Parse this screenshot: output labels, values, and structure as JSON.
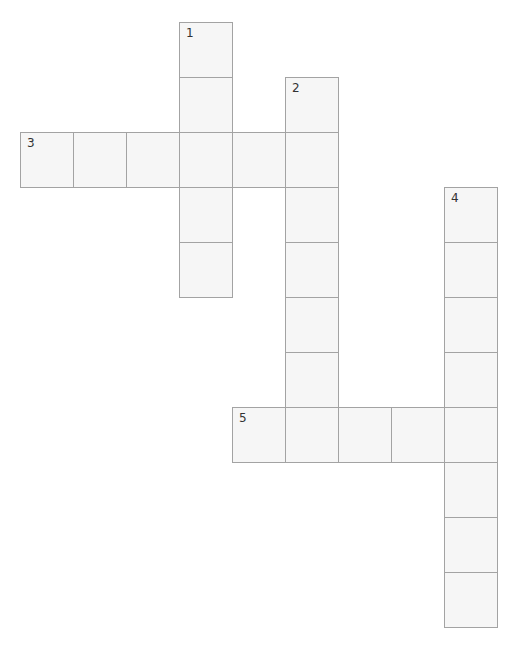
{
  "puzzle": {
    "grid": {
      "origin_x": 20,
      "origin_y": 22,
      "cell_w": 53,
      "cell_h": 55
    },
    "colors": {
      "cell_fill": "#f6f6f6",
      "cell_border": "#a3a3a3",
      "number": "#333333"
    },
    "entries": [
      {
        "number": "1",
        "direction": "down",
        "row": 0,
        "col": 3,
        "length": 5
      },
      {
        "number": "2",
        "direction": "down",
        "row": 1,
        "col": 5,
        "length": 7
      },
      {
        "number": "3",
        "direction": "across",
        "row": 2,
        "col": 0,
        "length": 6
      },
      {
        "number": "4",
        "direction": "down",
        "row": 3,
        "col": 8,
        "length": 8
      },
      {
        "number": "5",
        "direction": "across",
        "row": 7,
        "col": 4,
        "length": 5
      }
    ]
  }
}
